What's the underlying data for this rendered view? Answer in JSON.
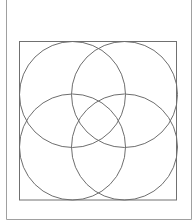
{
  "diagram": {
    "type": "four-circle overlap pattern inside square",
    "canvas": {
      "width": 195,
      "height": 223,
      "background": "#ffffff"
    },
    "frame": {
      "left": 6.5,
      "right": 191.5,
      "top": -2,
      "bottom": 219.5,
      "stroke": "#a0a0a0",
      "stroke_width": 1,
      "open_top": true
    },
    "inner_square": {
      "x": 19.5,
      "y": 41.5,
      "width": 157,
      "height": 158.5,
      "stroke": "#707070",
      "stroke_width": 1
    },
    "circles": [
      {
        "name": "top-left",
        "cx": 72.5,
        "cy": 94.5,
        "r": 53
      },
      {
        "name": "top-right",
        "cx": 124.5,
        "cy": 94.5,
        "r": 53
      },
      {
        "name": "bottom-left",
        "cx": 72.5,
        "cy": 147,
        "r": 53
      },
      {
        "name": "bottom-right",
        "cx": 124.5,
        "cy": 147,
        "r": 53
      }
    ],
    "circle_stroke": "#6e6e6e",
    "circle_stroke_width": 1
  }
}
